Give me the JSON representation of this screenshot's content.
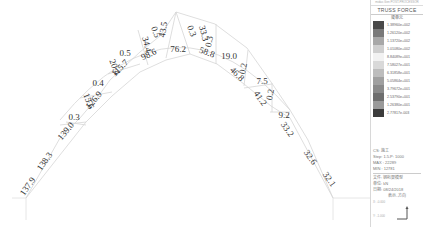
{
  "diagram": {
    "type": "truss-force-diagram",
    "labels": [
      {
        "text": "137.9",
        "x": 30,
        "y": 188,
        "rot": -55
      },
      {
        "text": "138.3",
        "x": 47,
        "y": 163,
        "rot": -55
      },
      {
        "text": "139.0",
        "x": 68,
        "y": 133,
        "rot": -50
      },
      {
        "text": "0.3",
        "x": 74,
        "y": 120,
        "rot": 0
      },
      {
        "text": "15.6",
        "x": 86,
        "y": 102,
        "rot": 70
      },
      {
        "text": "126.9",
        "x": 96,
        "y": 102,
        "rot": -50
      },
      {
        "text": "0.4",
        "x": 98,
        "y": 86,
        "rot": 0
      },
      {
        "text": "20.4",
        "x": 112,
        "y": 68,
        "rot": 70
      },
      {
        "text": "115.7",
        "x": 122,
        "y": 70,
        "rot": -45
      },
      {
        "text": "0.5",
        "x": 125,
        "y": 56,
        "rot": 0
      },
      {
        "text": "34.4",
        "x": 144,
        "y": 45,
        "rot": 75
      },
      {
        "text": "98.6",
        "x": 150,
        "y": 57,
        "rot": -25
      },
      {
        "text": "0.5",
        "x": 153,
        "y": 33,
        "rot": 70
      },
      {
        "text": "43.5",
        "x": 166,
        "y": 30,
        "rot": -80
      },
      {
        "text": "76.2",
        "x": 178,
        "y": 52,
        "rot": 0
      },
      {
        "text": "0.3",
        "x": 189,
        "y": 32,
        "rot": 70
      },
      {
        "text": "33.3",
        "x": 201,
        "y": 34,
        "rot": 75
      },
      {
        "text": "0.3",
        "x": 212,
        "y": 42,
        "rot": -80
      },
      {
        "text": "58.8",
        "x": 206,
        "y": 55,
        "rot": 20
      },
      {
        "text": "19.0",
        "x": 229,
        "y": 59,
        "rot": 0
      },
      {
        "text": "0.2",
        "x": 246,
        "y": 69,
        "rot": -80
      },
      {
        "text": "46.8",
        "x": 235,
        "y": 76,
        "rot": 45
      },
      {
        "text": "7.5",
        "x": 262,
        "y": 84,
        "rot": 0
      },
      {
        "text": "0.2",
        "x": 273,
        "y": 95,
        "rot": -80
      },
      {
        "text": "41.2",
        "x": 258,
        "y": 100,
        "rot": 55
      },
      {
        "text": "9.2",
        "x": 284,
        "y": 118,
        "rot": 0
      },
      {
        "text": "33.2",
        "x": 285,
        "y": 131,
        "rot": 55
      },
      {
        "text": "32.6",
        "x": 308,
        "y": 159,
        "rot": 55
      },
      {
        "text": "32.1",
        "x": 327,
        "y": 181,
        "rot": 55
      }
    ]
  },
  "legend": {
    "header": "midas Gen POST-PROCESSOR",
    "title": "TRUSS FORCE",
    "unit": "梁单元",
    "scale": [
      {
        "value": "1.38960e+002",
        "color": "#4a4a4a"
      },
      {
        "value": "1.26120e+002",
        "color": "#7a7a7a"
      },
      {
        "value": "1.13720e+002",
        "color": "#a8a8a8"
      },
      {
        "value": "1.01080e+002",
        "color": "#cfcfcf"
      },
      {
        "value": "8.84089e+001",
        "color": "#f2f2f2"
      },
      {
        "value": "7.58027e+001",
        "color": "#d9d9d9"
      },
      {
        "value": "6.31858e+001",
        "color": "#bdbdbd"
      },
      {
        "value": "5.05864e+001",
        "color": "#a0a0a0"
      },
      {
        "value": "3.79672e+001",
        "color": "#8a8a8a"
      },
      {
        "value": "2.53790e+001",
        "color": "#6e6e6e"
      },
      {
        "value": "1.26380e+001",
        "color": "#9a9a9a"
      },
      {
        "value": "2.77817e-003",
        "color": "#3c3c3c"
      }
    ],
    "info": {
      "cs": "CS: 施工",
      "step": "Step: 1.5.P: 1000",
      "max": "MAX : 22289",
      "min": "MIN : 12781",
      "file": "文件: 钢桁架模型",
      "unit": "单位: kN",
      "date": "日期: 08/24/2018",
      "view": "表示-方向"
    },
    "bottom": [
      "X: -0.000",
      "Y: -1.000"
    ]
  }
}
